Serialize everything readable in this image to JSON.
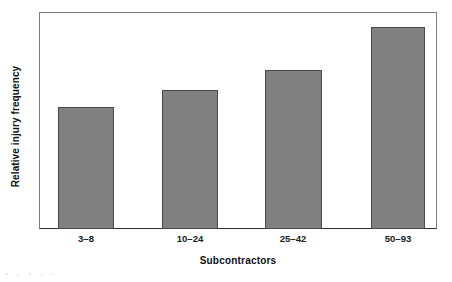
{
  "chart_data": {
    "type": "bar",
    "title": "",
    "xlabel": "Subcontractors",
    "ylabel": "Relative injury frequency",
    "categories": [
      "3–8",
      "10–24",
      "25–42",
      "50–93"
    ],
    "values": [
      1.0,
      1.14,
      1.3,
      1.66
    ],
    "value_unit": "relative (lowest bar = 1.00)",
    "ylim": [
      0,
      1.78
    ],
    "grid": false,
    "legend": null,
    "y_tick_labels": [],
    "x_tick_labels": [
      "3–8",
      "10–24",
      "25–42",
      "50–93"
    ],
    "bar_fill_color": "#808080",
    "bar_edge_color": "#4a4a4a",
    "frame_color": "#7e7e7e",
    "axis_color": "#2d2d2d",
    "background_color": "#ffffff",
    "bars": [
      {
        "label": "3–8",
        "value": 1.0,
        "height_px": 122,
        "left_px": 19,
        "width_px": 56,
        "center_px": 47
      },
      {
        "label": "10–24",
        "value": 1.14,
        "height_px": 139,
        "left_px": 123,
        "width_px": 56,
        "center_px": 151
      },
      {
        "label": "25–42",
        "value": 1.3,
        "height_px": 159,
        "left_px": 226,
        "width_px": 57,
        "center_px": 254
      },
      {
        "label": "50–93",
        "value": 1.66,
        "height_px": 202,
        "left_px": 332,
        "width_px": 54,
        "center_px": 359
      }
    ]
  }
}
